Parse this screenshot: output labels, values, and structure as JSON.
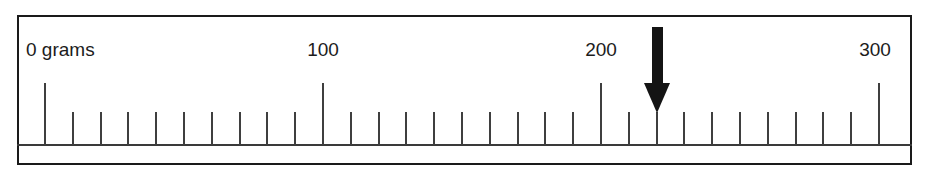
{
  "figure": {
    "kind": "measurement-scale",
    "unit_label": "grams"
  },
  "chart_data": {
    "type": "bar",
    "title": "",
    "subtitle": "",
    "xlabel": "grams",
    "ylabel": "",
    "categories": [
      "0 grams",
      "100",
      "200",
      "300"
    ],
    "values": [
      0,
      100,
      200,
      300
    ],
    "xlim": [
      0,
      300
    ],
    "ylim": [
      0,
      0
    ],
    "grid": false,
    "legend": "none",
    "axis": {
      "min": 0,
      "max": 300,
      "major_interval": 100,
      "minor_interval": 10,
      "minor_ticks_between_majors": 9
    },
    "major_ticks": [
      {
        "value": 0,
        "label": "0 grams",
        "x": 45
      },
      {
        "value": 100,
        "label": "100",
        "x": 323
      },
      {
        "value": 200,
        "label": "200",
        "x": 601
      },
      {
        "value": 300,
        "label": "300",
        "x": 879
      }
    ],
    "annotations": [
      {
        "kind": "pointer-arrow",
        "points_to_value": 220,
        "x": 657,
        "direction": "down"
      }
    ]
  },
  "labels": {
    "zero": "0 grams",
    "hundred": "100",
    "two_hundred": "200",
    "three_hundred": "300"
  },
  "colors": {
    "frame": "#1a1a1a",
    "tick": "#3f3f3f",
    "baseline": "#3a3a3a",
    "arrow": "#141414",
    "background": "#ffffff",
    "text": "#1c1c1c"
  }
}
